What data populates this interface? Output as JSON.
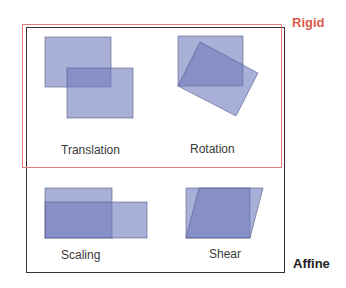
{
  "groups": {
    "rigid": {
      "label": "Rigid",
      "color": "#e05a4a"
    },
    "affine": {
      "label": "Affine",
      "color": "#222222"
    }
  },
  "panels": [
    {
      "label": "Translation"
    },
    {
      "label": "Rotation"
    },
    {
      "label": "Scaling"
    },
    {
      "label": "Shear"
    }
  ],
  "colors": {
    "shape_fill": "#6f7cbc",
    "shape_stroke": "#4a5286"
  }
}
